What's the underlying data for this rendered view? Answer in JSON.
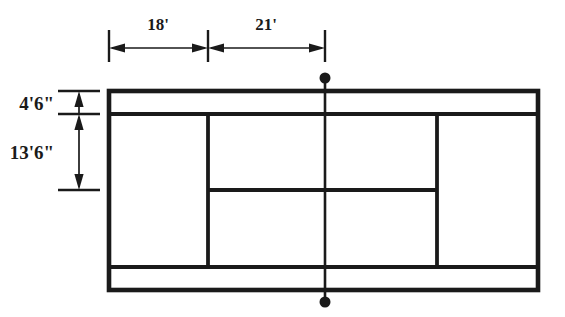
{
  "diagram": {
    "line_color": "#1a1a1a",
    "fill_color": "#ffffff",
    "dimensions": {
      "horizontal": [
        {
          "label": "18'",
          "name": "alley-to-service-line-width",
          "from_px": 109,
          "to_px": 208
        },
        {
          "label": "21'",
          "name": "service-line-to-net-width",
          "from_px": 208,
          "to_px": 325
        }
      ],
      "vertical": [
        {
          "label": "4'6\"",
          "name": "doubles-alley-width",
          "from_px": 91,
          "to_px": 114
        },
        {
          "label": "13'6\"",
          "name": "service-box-depth",
          "from_px": 114,
          "to_px": 190
        }
      ]
    },
    "court_geometry": {
      "outer_left": 109,
      "outer_right": 538,
      "outer_top": 91,
      "outer_bottom": 290,
      "top_alley_line": 114,
      "bottom_alley_line": 267,
      "left_service_sideline": 208,
      "right_service_sideline": 437,
      "center_service_line": 190,
      "net_x": 325,
      "net_dot_top_y": 78,
      "net_dot_bottom_y": 302,
      "net_post_dot_radius": 5.5
    }
  }
}
